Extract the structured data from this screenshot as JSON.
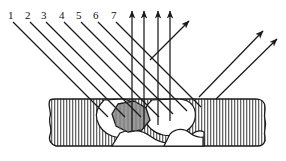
{
  "figure": {
    "type": "technical-line-diagram",
    "width": 286,
    "height": 161,
    "background_color": "#ffffff",
    "line_color": "#1a1a1a",
    "hatch_color": "#555555",
    "inclusion_fill": "#9a9a9a",
    "void_fill": "#ffffff"
  },
  "labels": {
    "items": [
      {
        "text": "1",
        "x": 8,
        "y": 10
      },
      {
        "text": "2",
        "x": 25,
        "y": 10
      },
      {
        "text": "3",
        "x": 41,
        "y": 10
      },
      {
        "text": "4",
        "x": 59,
        "y": 10
      },
      {
        "text": "5",
        "x": 76,
        "y": 10
      },
      {
        "text": "6",
        "x": 93,
        "y": 10
      },
      {
        "text": "7",
        "x": 111,
        "y": 10
      }
    ]
  },
  "incident_rays": {
    "description": "seven-down-right-diagonal-rays-from-numbered-labels",
    "count": 7,
    "items": [
      {
        "id": "ray-1",
        "x1": 13,
        "y1": 22,
        "x2": 107,
        "y2": 116
      },
      {
        "id": "ray-2",
        "x1": 30,
        "y1": 22,
        "x2": 124,
        "y2": 116
      },
      {
        "id": "ray-3",
        "x1": 46,
        "y1": 22,
        "x2": 140,
        "y2": 116
      },
      {
        "id": "ray-4",
        "x1": 64,
        "y1": 22,
        "x2": 158,
        "y2": 116
      },
      {
        "id": "ray-5",
        "x1": 81,
        "y1": 22,
        "x2": 172,
        "y2": 113
      },
      {
        "id": "ray-6",
        "x1": 98,
        "y1": 22,
        "x2": 186,
        "y2": 110
      },
      {
        "id": "ray-7",
        "x1": 116,
        "y1": 22,
        "x2": 200,
        "y2": 106
      }
    ]
  },
  "vertical_rays": {
    "description": "upward-backscattered-vertical-arrows",
    "count": 4,
    "items": [
      {
        "id": "vert-1",
        "x": 132,
        "y_bottom": 132,
        "y_top": 10
      },
      {
        "id": "vert-2",
        "x": 144,
        "y_bottom": 128,
        "y_top": 10
      },
      {
        "id": "vert-3",
        "x": 158,
        "y_bottom": 124,
        "y_top": 10
      },
      {
        "id": "vert-4",
        "x": 170,
        "y_bottom": 120,
        "y_top": 10
      }
    ]
  },
  "diagonal_exit_rays": {
    "description": "upward-right-scattered-arrows",
    "count": 3,
    "items": [
      {
        "id": "exit-1",
        "x1": 150,
        "y1": 60,
        "x2": 188,
        "y2": 22
      },
      {
        "id": "exit-2",
        "x1": 198,
        "y1": 96,
        "x2": 262,
        "y2": 30
      },
      {
        "id": "exit-3",
        "x1": 215,
        "y1": 98,
        "x2": 276,
        "y2": 38
      }
    ]
  },
  "material_block": {
    "description": "vertically-hatched-specimen-with-wavy-edges",
    "left": 48,
    "right": 268,
    "top": 98,
    "bottom": 148,
    "hatch_spacing": 3,
    "edge_style": "wavy"
  },
  "voids": {
    "description": "internal-white-cavities-and-gray-inclusion",
    "count": 3,
    "items": [
      {
        "id": "void-left",
        "fill": "#ffffff"
      },
      {
        "id": "inclusion",
        "fill": "#9a9a9a"
      },
      {
        "id": "void-right",
        "fill": "#ffffff"
      }
    ]
  }
}
